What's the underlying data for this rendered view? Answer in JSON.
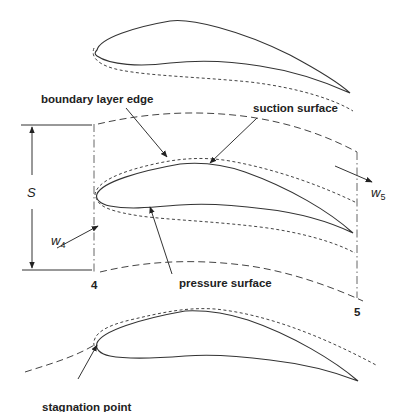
{
  "diagram": {
    "type": "turbine blade cascade with boundary layers",
    "labels": {
      "boundary_layer_edge": "boundary layer edge",
      "suction_surface": "suction surface",
      "pressure_surface": "pressure surface",
      "stagnation_point": "stagnation point",
      "station_inlet": "4",
      "station_outlet": "5",
      "pitch": "S",
      "inlet_velocity": "w",
      "inlet_velocity_sub": "4",
      "outlet_velocity": "w",
      "outlet_velocity_sub": "5"
    },
    "blades": [
      {
        "name": "top-blade"
      },
      {
        "name": "middle-blade"
      },
      {
        "name": "bottom-blade"
      }
    ],
    "colors": {
      "line": "#333333",
      "text": "#222222",
      "background": "#ffffff"
    }
  }
}
